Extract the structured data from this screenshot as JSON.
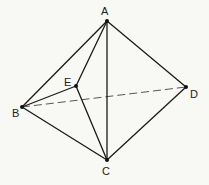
{
  "diagram": {
    "type": "tetrahedral-bipyramid",
    "points": {
      "A": {
        "label": "A",
        "x": 107,
        "y": 21,
        "lx": 101,
        "ly": 15
      },
      "B": {
        "label": "B",
        "x": 22,
        "y": 107,
        "lx": 12,
        "ly": 117
      },
      "C": {
        "label": "C",
        "x": 107,
        "y": 160,
        "lx": 102,
        "ly": 175
      },
      "D": {
        "label": "D",
        "x": 186,
        "y": 87,
        "lx": 190,
        "ly": 98
      },
      "E": {
        "label": "E",
        "x": 76,
        "y": 86,
        "lx": 64,
        "ly": 86
      }
    },
    "solid_edges": [
      [
        "A",
        "B"
      ],
      [
        "A",
        "C"
      ],
      [
        "A",
        "D"
      ],
      [
        "A",
        "E"
      ],
      [
        "B",
        "C"
      ],
      [
        "B",
        "E"
      ],
      [
        "C",
        "D"
      ],
      [
        "C",
        "E"
      ]
    ],
    "dashed_edges": [
      [
        "B",
        "D"
      ]
    ],
    "colors": {
      "background": "#f8f8f4",
      "stroke": "#1a1a1a"
    }
  }
}
